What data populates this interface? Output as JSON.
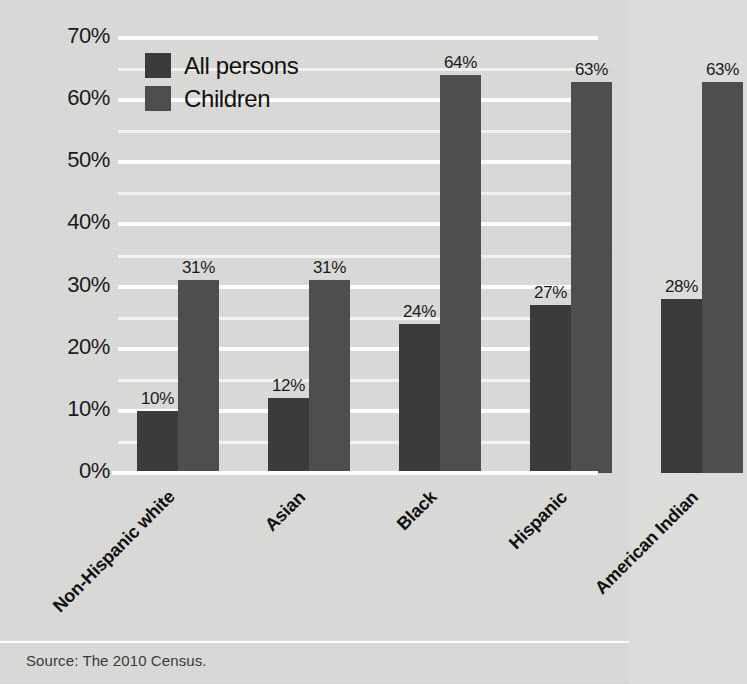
{
  "chart_data": {
    "type": "bar",
    "title": "",
    "xlabel": "",
    "ylabel": "",
    "ylim": [
      0,
      70
    ],
    "y_tick_labels": [
      "0%",
      "10%",
      "20%",
      "30%",
      "40%",
      "50%",
      "60%",
      "70%"
    ],
    "y_ticks": [
      0,
      10,
      20,
      30,
      40,
      50,
      60,
      70
    ],
    "minor_ticks": [
      5,
      15,
      25,
      35,
      45,
      55,
      65
    ],
    "grid": true,
    "grid_color": "#fdfdfd",
    "legend_position": "upper-left-inside",
    "categories": [
      "Non-Hispanic white",
      "Asian",
      "Black",
      "Hispanic",
      "American Indian"
    ],
    "series": [
      {
        "name": "All persons",
        "color": "#3b3b3b",
        "values": [
          10,
          12,
          24,
          27,
          28
        ],
        "value_labels": [
          "10%",
          "12%",
          "24%",
          "27%",
          "28%"
        ]
      },
      {
        "name": "Children",
        "color": "#4e4e4e",
        "values": [
          31,
          31,
          64,
          63,
          63
        ],
        "value_labels": [
          "31%",
          "31%",
          "64%",
          "63%",
          "63%"
        ]
      }
    ],
    "source_note": "Source: The 2010 Census."
  },
  "colors": {
    "background": "#dcdcdb",
    "gridline": "#fdfdfd",
    "all_persons": "#3b3b3b",
    "children": "#4e4e4e",
    "text": "#1b1b1b"
  }
}
